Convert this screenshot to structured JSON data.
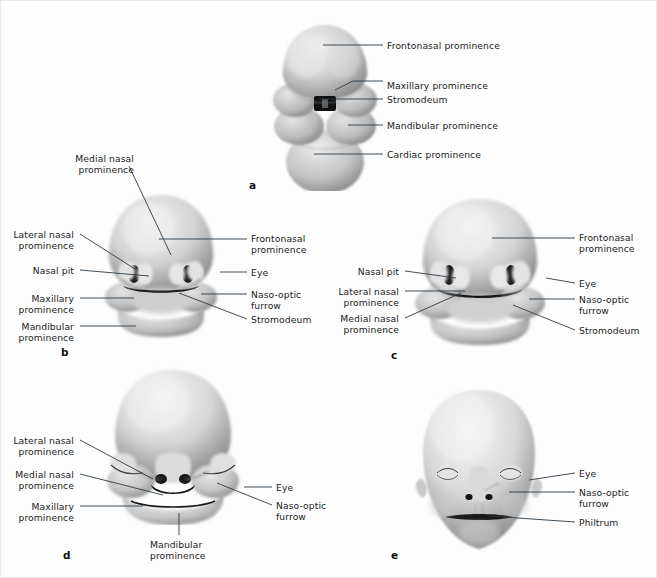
{
  "figure": {
    "background_color": "#fdfdfd",
    "border_color": "#e8e8e8",
    "label_color": "#1b1b1b",
    "leader_color": "#2b3a45",
    "width": 657,
    "height": 578
  },
  "panels": [
    {
      "letter": "a",
      "letter_x": 248,
      "letter_y": 178,
      "labels": [
        {
          "text": "Frontonasal prominence",
          "x": 386,
          "y": 39,
          "align": "left"
        },
        {
          "text": "Maxillary prominence",
          "x": 386,
          "y": 79,
          "align": "left"
        },
        {
          "text": "Stromodeum",
          "x": 386,
          "y": 93,
          "align": "left"
        },
        {
          "text": "Mandibular prominence",
          "x": 386,
          "y": 119,
          "align": "left"
        },
        {
          "text": "Cardiac prominence",
          "x": 386,
          "y": 148,
          "align": "left"
        }
      ]
    },
    {
      "letter": "b",
      "letter_x": 60,
      "letter_y": 345,
      "labels": [
        {
          "text": "Medial nasal\nprominence",
          "x": 135,
          "y": 152,
          "align": "right"
        },
        {
          "text": "Lateral nasal\nprominence",
          "x": 75,
          "y": 228,
          "align": "right"
        },
        {
          "text": "Nasal pit",
          "x": 75,
          "y": 264,
          "align": "right"
        },
        {
          "text": "Maxillary\nprominence",
          "x": 75,
          "y": 292,
          "align": "right"
        },
        {
          "text": "Mandibular\nprominence",
          "x": 75,
          "y": 320,
          "align": "right"
        },
        {
          "text": "Frontonasal\nprominence",
          "x": 250,
          "y": 232,
          "align": "left"
        },
        {
          "text": "Eye",
          "x": 250,
          "y": 266,
          "align": "left"
        },
        {
          "text": "Naso-optic\nfurrow",
          "x": 250,
          "y": 288,
          "align": "left"
        },
        {
          "text": "Stromodeum",
          "x": 250,
          "y": 313,
          "align": "left"
        }
      ]
    },
    {
      "letter": "c",
      "letter_x": 390,
      "letter_y": 348,
      "labels": [
        {
          "text": "Nasal pit",
          "x": 400,
          "y": 265,
          "align": "right"
        },
        {
          "text": "Lateral nasal\nprominence",
          "x": 400,
          "y": 285,
          "align": "right"
        },
        {
          "text": "Medial nasal\nprominence",
          "x": 400,
          "y": 312,
          "align": "right"
        },
        {
          "text": "Frontonasal\nprominence",
          "x": 578,
          "y": 231,
          "align": "left"
        },
        {
          "text": "Eye",
          "x": 578,
          "y": 277,
          "align": "left"
        },
        {
          "text": "Naso-optic\nfurrow",
          "x": 578,
          "y": 293,
          "align": "left"
        },
        {
          "text": "Stromodeum",
          "x": 578,
          "y": 324,
          "align": "left"
        }
      ]
    },
    {
      "letter": "d",
      "letter_x": 62,
      "letter_y": 548,
      "labels": [
        {
          "text": "Lateral nasal\nprominence",
          "x": 75,
          "y": 434,
          "align": "right"
        },
        {
          "text": "Medial nasal\nprominence",
          "x": 75,
          "y": 468,
          "align": "right"
        },
        {
          "text": "Maxillary\nprominence",
          "x": 75,
          "y": 500,
          "align": "right"
        },
        {
          "text": "Mandibular\nprominence",
          "x": 149,
          "y": 538,
          "align": "left"
        },
        {
          "text": "Eye",
          "x": 275,
          "y": 481,
          "align": "left"
        },
        {
          "text": "Naso-optic\nfurrow",
          "x": 275,
          "y": 499,
          "align": "left"
        }
      ]
    },
    {
      "letter": "e",
      "letter_x": 390,
      "letter_y": 548,
      "labels": [
        {
          "text": "Eye",
          "x": 578,
          "y": 467,
          "align": "left"
        },
        {
          "text": "Naso-optic\nfurrow",
          "x": 578,
          "y": 486,
          "align": "left"
        },
        {
          "text": "Philtrum",
          "x": 578,
          "y": 516,
          "align": "left"
        }
      ]
    }
  ],
  "leaders": [
    {
      "panel": "a",
      "points": "382,44 322,44"
    },
    {
      "panel": "a",
      "points": "382,80 352,80 334,89"
    },
    {
      "panel": "a",
      "points": "382,98 318,98"
    },
    {
      "panel": "a",
      "points": "382,124 347,124"
    },
    {
      "panel": "a",
      "points": "382,153 313,153"
    },
    {
      "panel": "b",
      "points": "128,165 170,254"
    },
    {
      "panel": "b",
      "points": "79,233 134,268"
    },
    {
      "panel": "b",
      "points": "79,269 148,275"
    },
    {
      "panel": "b",
      "points": "79,297 133,297"
    },
    {
      "panel": "b",
      "points": "79,325 135,325"
    },
    {
      "panel": "b",
      "points": "246,238 158,238"
    },
    {
      "panel": "b",
      "points": "246,271 219,271"
    },
    {
      "panel": "b",
      "points": "246,293 200,293"
    },
    {
      "panel": "b",
      "points": "246,318 178,292"
    },
    {
      "panel": "c",
      "points": "404,270 455,277"
    },
    {
      "panel": "c",
      "points": "404,290 464,290"
    },
    {
      "panel": "c",
      "points": "404,317 460,292"
    },
    {
      "panel": "c",
      "points": "574,237 491,237"
    },
    {
      "panel": "c",
      "points": "574,282 545,277"
    },
    {
      "panel": "c",
      "points": "574,298 528,298"
    },
    {
      "panel": "c",
      "points": "574,329 512,304"
    },
    {
      "panel": "d",
      "points": "79,439 152,478"
    },
    {
      "panel": "d",
      "points": "79,473 162,494"
    },
    {
      "panel": "d",
      "points": "79,505 142,505"
    },
    {
      "panel": "d",
      "points": "178,534 178,512"
    },
    {
      "panel": "d",
      "points": "271,486 243,486"
    },
    {
      "panel": "d",
      "points": "271,504 216,482"
    },
    {
      "panel": "e",
      "points": "574,472 528,479"
    },
    {
      "panel": "e",
      "points": "574,491 508,491"
    },
    {
      "panel": "e",
      "points": "574,521 488,515"
    }
  ]
}
